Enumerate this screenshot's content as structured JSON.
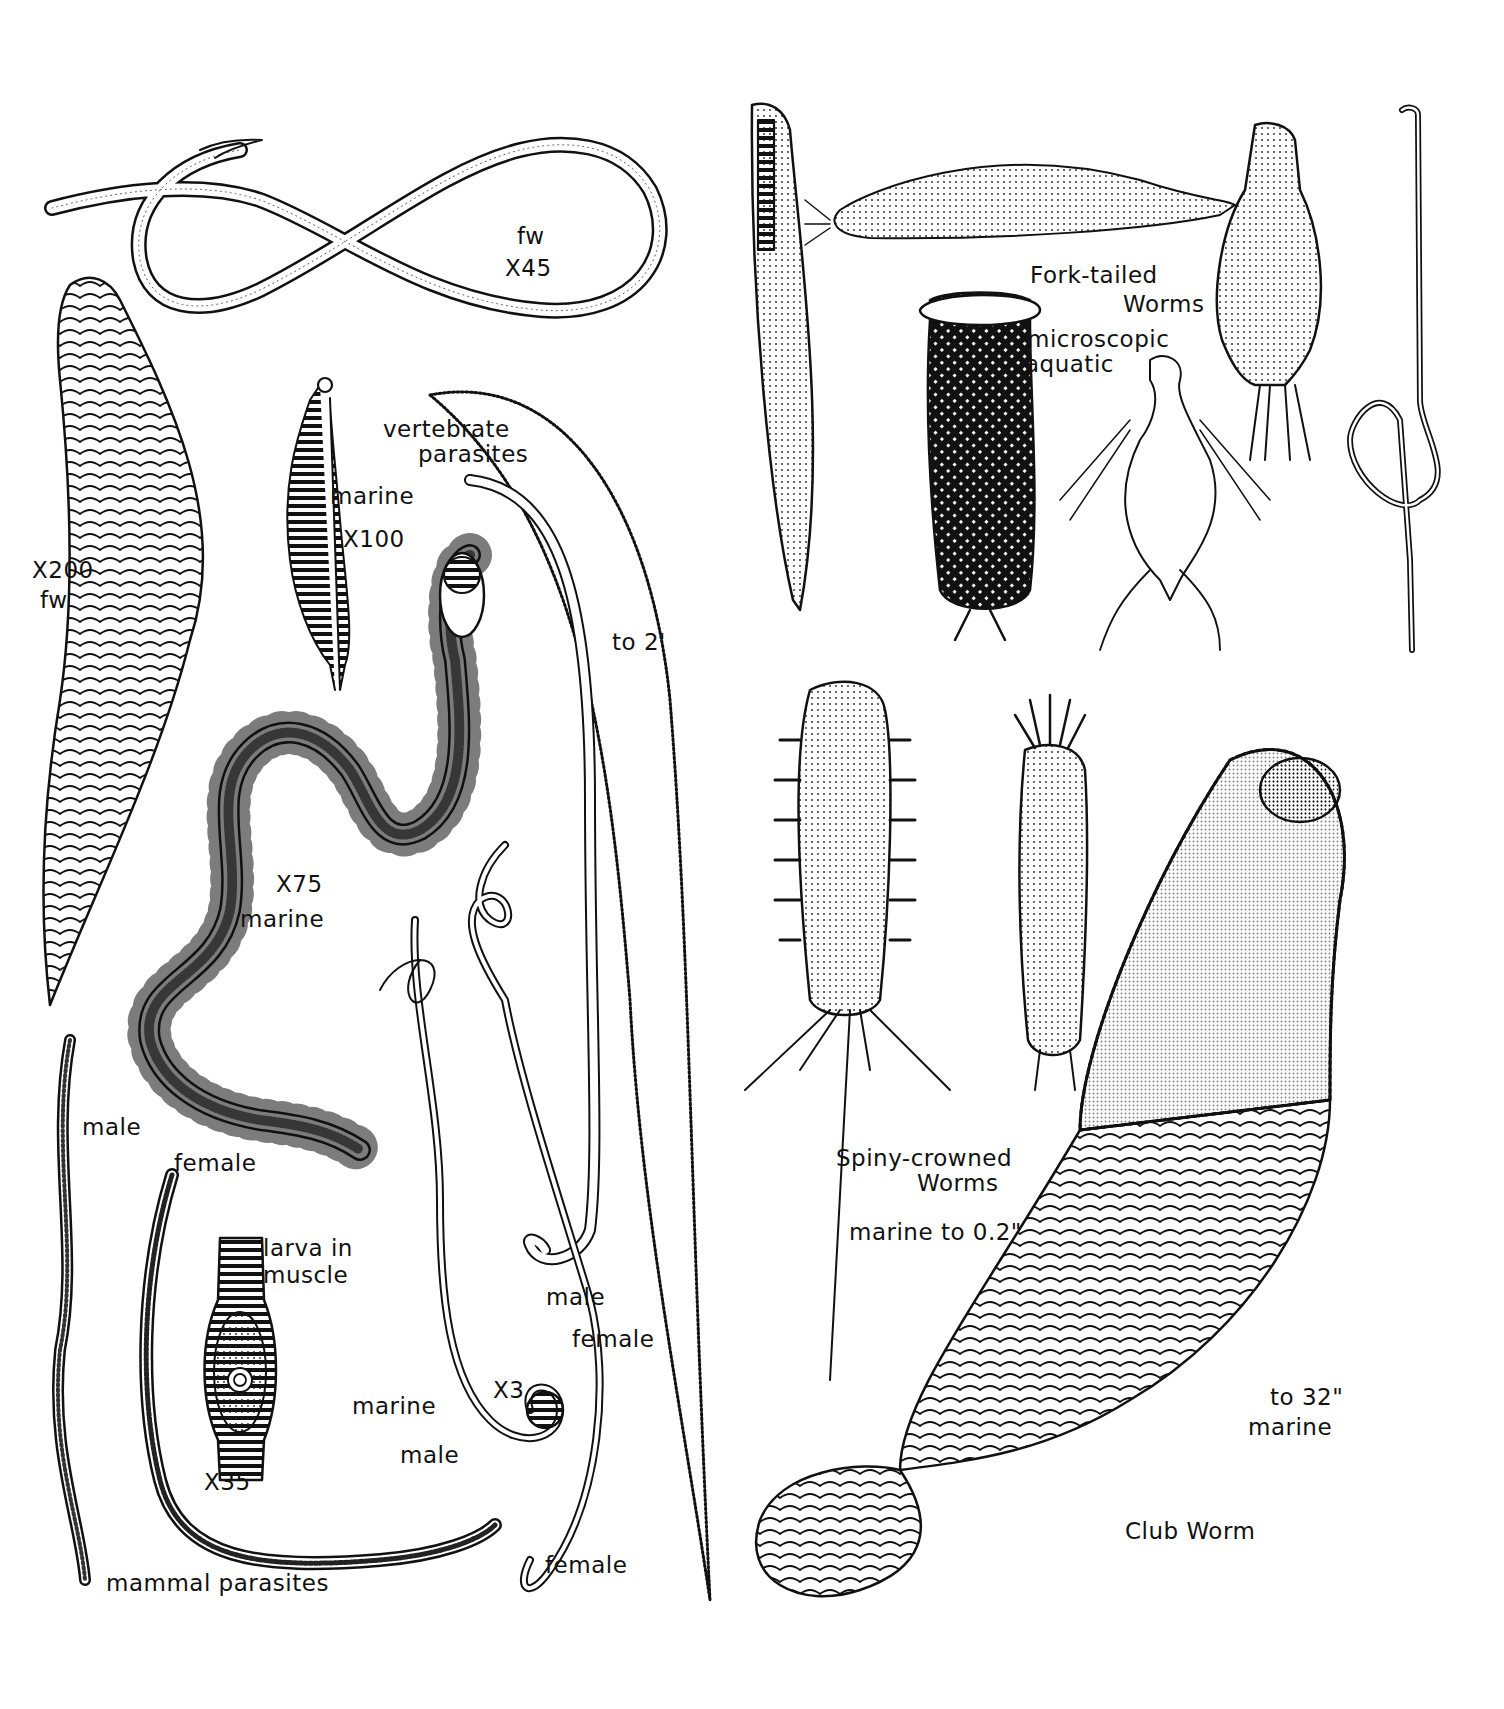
{
  "plate": {
    "background": "#ffffff",
    "ink": "#111111",
    "labels": {
      "fw_x45": [
        "fw",
        "X45"
      ],
      "x200_fw": [
        "X200",
        "fw"
      ],
      "marine_x100": [
        "marine",
        "X100"
      ],
      "vertebrate_parasites": [
        "vertebrate",
        "parasites"
      ],
      "to_2ft": "to 2'",
      "x75": "X75",
      "x75_marine": "marine",
      "male_left": "male",
      "female_left": "female",
      "larva_in_muscle": [
        "larva in",
        "muscle"
      ],
      "x35": "X35",
      "mammal_parasites": "mammal parasites",
      "marine_mid": "marine",
      "x3": "X3",
      "male_mid": "male",
      "female_mid_bottom": "female",
      "male_hook": "male",
      "female_long": "female",
      "fork_tailed": [
        "Fork-tailed",
        "Worms"
      ],
      "microscopic_aquatic": [
        "microscopic",
        "aquatic"
      ],
      "spiny_crowned": [
        "Spiny-crowned",
        "Worms"
      ],
      "spiny_size": "marine  to 0.2\"",
      "club_size": [
        "to 32\"",
        "marine"
      ],
      "club_worm": "Club Worm"
    }
  }
}
